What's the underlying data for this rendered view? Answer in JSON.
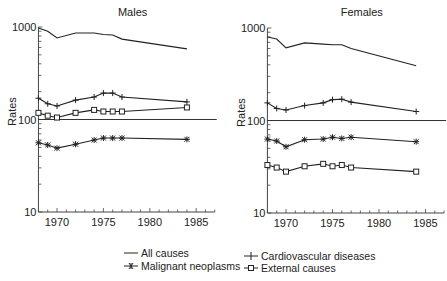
{
  "chart_data": [
    {
      "type": "line",
      "title": "Males",
      "xlabel": "",
      "ylabel": "Rates",
      "yscale": "log",
      "ylim": [
        10,
        1000
      ],
      "xlim": [
        1968,
        1987
      ],
      "xticks": [
        "1970",
        "1975",
        "1980",
        "1985"
      ],
      "yticks": [
        "10",
        "100",
        "1000"
      ],
      "reference_line": 100,
      "x": [
        1968,
        1969,
        1970,
        1972,
        1974,
        1975,
        1976,
        1977,
        1984
      ],
      "series": [
        {
          "name": "All causes",
          "marker": "none",
          "values": [
            975,
            900,
            760,
            860,
            860,
            830,
            820,
            740,
            580
          ]
        },
        {
          "name": "Cardiovascular diseases",
          "marker": "plus",
          "values": [
            170,
            148,
            140,
            162,
            175,
            193,
            193,
            175,
            155
          ]
        },
        {
          "name": "External causes",
          "marker": "square",
          "values": [
            118,
            110,
            105,
            118,
            127,
            122,
            122,
            122,
            135
          ]
        },
        {
          "name": "Malignant neoplasms",
          "marker": "star",
          "values": [
            56,
            53,
            49,
            54,
            60,
            63,
            63,
            63,
            61
          ]
        }
      ]
    },
    {
      "type": "line",
      "title": "Females",
      "xlabel": "",
      "ylabel": "Rates",
      "yscale": "log",
      "ylim": [
        10,
        1000
      ],
      "xlim": [
        1968,
        1987
      ],
      "xticks": [
        "1970",
        "1975",
        "1980",
        "1985"
      ],
      "yticks": [
        "10",
        "100",
        "1000"
      ],
      "reference_line": 100,
      "x": [
        1968,
        1969,
        1970,
        1972,
        1974,
        1975,
        1976,
        1977,
        1984
      ],
      "series": [
        {
          "name": "All causes",
          "marker": "none",
          "values": [
            800,
            760,
            610,
            690,
            670,
            660,
            660,
            600,
            390
          ]
        },
        {
          "name": "Cardiovascular diseases",
          "marker": "plus",
          "values": [
            155,
            135,
            130,
            145,
            155,
            168,
            170,
            158,
            125
          ]
        },
        {
          "name": "Malignant neoplasms",
          "marker": "star",
          "values": [
            63,
            60,
            52,
            62,
            63,
            66,
            64,
            66,
            59
          ]
        },
        {
          "name": "External causes",
          "marker": "square",
          "values": [
            33,
            31,
            28,
            32,
            34,
            32,
            33,
            31,
            28
          ]
        }
      ]
    }
  ],
  "legend": {
    "items": [
      {
        "label": "All causes",
        "marker": "none"
      },
      {
        "label": "Malignant neoplasms",
        "marker": "star"
      },
      {
        "label": "Cardiovascular diseases",
        "marker": "plus"
      },
      {
        "label": "External causes",
        "marker": "square"
      }
    ]
  }
}
